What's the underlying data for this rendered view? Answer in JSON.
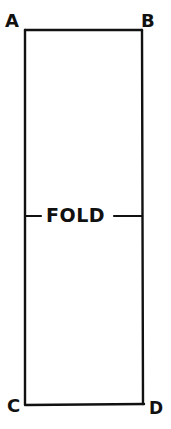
{
  "diagram": {
    "corners": [
      {
        "label": "A",
        "position": "top-left"
      },
      {
        "label": "B",
        "position": "top-right"
      },
      {
        "label": "C",
        "position": "bottom-left"
      },
      {
        "label": "D",
        "position": "bottom-right"
      }
    ],
    "fold_label": "FOLD",
    "stroke_color": "#111111",
    "background": "#ffffff"
  }
}
